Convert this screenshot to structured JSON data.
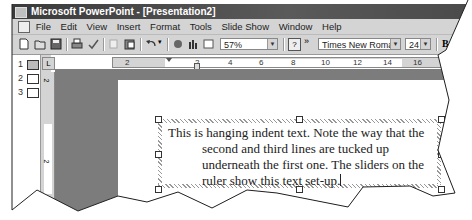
{
  "window": {
    "title": "Microsoft PowerPoint - [Presentation2]"
  },
  "menubar": {
    "items": [
      "File",
      "Edit",
      "View",
      "Insert",
      "Format",
      "Tools",
      "Slide Show",
      "Window",
      "Help"
    ]
  },
  "toolbar": {
    "zoom_value": "57%",
    "font_name": "Times New Roman",
    "font_size": "24",
    "bold_label": "B",
    "italic_label": "I",
    "help_label": "?",
    "more_label": "»"
  },
  "outline": {
    "slides": [
      {
        "number": "1",
        "selected": true
      },
      {
        "number": "2",
        "selected": false
      },
      {
        "number": "3",
        "selected": false
      }
    ]
  },
  "ruler": {
    "corner_label": "L",
    "ticks": [
      "2",
      "0",
      "2",
      "4",
      "6",
      "8",
      "10",
      "12",
      "14",
      "16",
      "1"
    ],
    "vertical_ticks": [
      "2",
      "0",
      "2"
    ]
  },
  "slide": {
    "textbox": {
      "lines": [
        "This is hanging indent text. Note the way that the",
        "second and third lines are tucked up",
        "underneath the first one. The sliders on the",
        "ruler show this text set-up."
      ]
    }
  }
}
